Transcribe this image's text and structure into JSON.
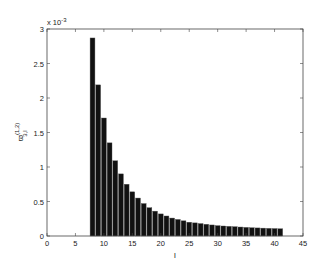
{
  "chart_data": {
    "type": "bar",
    "title": "",
    "xlabel": "l",
    "ylabel": "ϖ_{3,l}^{(1,2)}",
    "y_exponent_label": "x 10^-3",
    "y_multiplier": 0.001,
    "xlim": [
      0,
      45
    ],
    "ylim": [
      0,
      3
    ],
    "xticks": [
      0,
      5,
      10,
      15,
      20,
      25,
      30,
      35,
      40,
      45
    ],
    "yticks": [
      0,
      0.5,
      1,
      1.5,
      2,
      2.5,
      3
    ],
    "ytick_labels": [
      "0",
      "0.5",
      "1",
      "1.5",
      "2",
      "2.5",
      "3"
    ],
    "grid": false,
    "legend": null,
    "bar_color": "#111111",
    "bar_edge_color": "#555555",
    "x": [
      8,
      9,
      10,
      11,
      12,
      13,
      14,
      15,
      16,
      17,
      18,
      19,
      20,
      21,
      22,
      23,
      24,
      25,
      26,
      27,
      28,
      29,
      30,
      31,
      32,
      33,
      34,
      35,
      36,
      37,
      38,
      39,
      40,
      41
    ],
    "values": [
      2.87,
      2.19,
      1.71,
      1.35,
      1.09,
      0.9,
      0.75,
      0.64,
      0.55,
      0.47,
      0.41,
      0.36,
      0.32,
      0.29,
      0.26,
      0.24,
      0.22,
      0.2,
      0.19,
      0.18,
      0.17,
      0.16,
      0.15,
      0.145,
      0.14,
      0.135,
      0.13,
      0.125,
      0.12,
      0.117,
      0.114,
      0.111,
      0.108,
      0.105
    ]
  }
}
